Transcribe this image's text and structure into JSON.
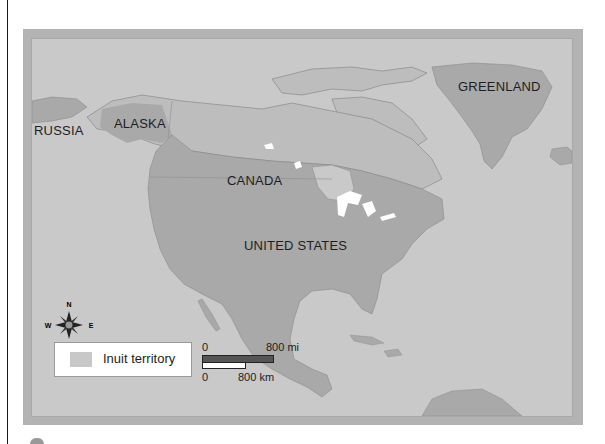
{
  "map": {
    "labels": {
      "russia": "RUSSIA",
      "alaska": "ALASKA",
      "canada": "CANADA",
      "greenland": "GREENLAND",
      "united_states": "UNITED STATES"
    },
    "compass": {
      "n": "N",
      "s": "S",
      "e": "E",
      "w": "W"
    },
    "legend": {
      "label": "Inuit territory",
      "swatch_color": "#c8c8c8"
    },
    "scale": {
      "mi_start": "0",
      "mi_end": "800 mi",
      "km_start": "0",
      "km_end": "800 km"
    },
    "colors": {
      "ocean": "#c9c9c9",
      "land": "#a9a9a9",
      "inuit_territory": "#bdbdbd",
      "frame": "#b3b3b3",
      "lakes": "#ffffff"
    }
  }
}
